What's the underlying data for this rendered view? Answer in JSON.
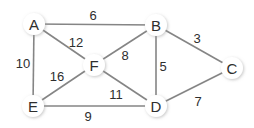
{
  "diagram": {
    "type": "weighted-undirected-graph",
    "nodes": [
      {
        "id": "A",
        "label": "A",
        "x": 34,
        "y": 24
      },
      {
        "id": "B",
        "label": "B",
        "x": 156,
        "y": 25
      },
      {
        "id": "C",
        "label": "C",
        "x": 232,
        "y": 68
      },
      {
        "id": "D",
        "label": "D",
        "x": 156,
        "y": 106
      },
      {
        "id": "E",
        "label": "E",
        "x": 33,
        "y": 106
      },
      {
        "id": "F",
        "label": "F",
        "x": 94,
        "y": 65
      }
    ],
    "edges": [
      {
        "from": "A",
        "to": "B",
        "weight": "6",
        "label_x": 93,
        "label_y": 15
      },
      {
        "from": "A",
        "to": "F",
        "weight": "12",
        "label_x": 76,
        "label_y": 42
      },
      {
        "from": "A",
        "to": "E",
        "weight": "10",
        "label_x": 23,
        "label_y": 63
      },
      {
        "from": "B",
        "to": "F",
        "weight": "8",
        "label_x": 125,
        "label_y": 55
      },
      {
        "from": "B",
        "to": "D",
        "weight": "5",
        "label_x": 163,
        "label_y": 66
      },
      {
        "from": "B",
        "to": "C",
        "weight": "3",
        "label_x": 197,
        "label_y": 38
      },
      {
        "from": "C",
        "to": "D",
        "weight": "7",
        "label_x": 198,
        "label_y": 101
      },
      {
        "from": "F",
        "to": "E",
        "weight": "16",
        "label_x": 57,
        "label_y": 76
      },
      {
        "from": "F",
        "to": "D",
        "weight": "11",
        "label_x": 116,
        "label_y": 94
      },
      {
        "from": "E",
        "to": "D",
        "weight": "9",
        "label_x": 88,
        "label_y": 116
      }
    ],
    "colors": {
      "edge": "#858585",
      "node_fill": "#ffffff",
      "node_shadow": "#c8c8c8",
      "text": "#2e2e2e"
    }
  }
}
